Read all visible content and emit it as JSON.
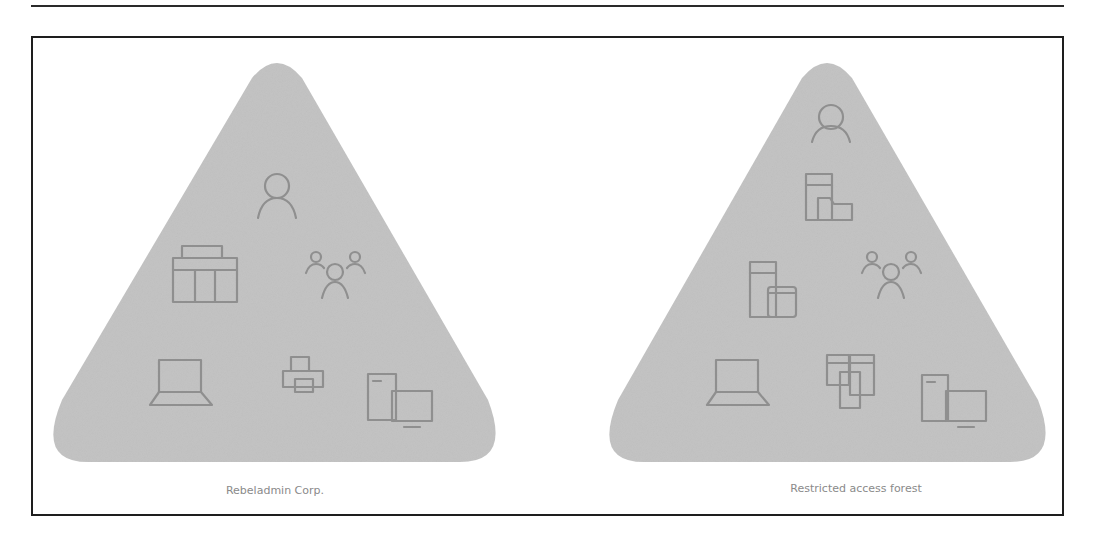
{
  "colors": {
    "rule": "#2a2a2a",
    "frame": "#1e1e1e",
    "triangle_fill": "#c4c4c4",
    "icon_stroke": "#8f8f8f",
    "caption_text": "#8a8a8a"
  },
  "panels": [
    {
      "caption": "Rebeladmin Corp.",
      "icons": [
        "user-icon",
        "building-icon",
        "group-icon",
        "laptop-icon",
        "printer-icon",
        "devices-icon"
      ]
    },
    {
      "caption": "Restricted access forest",
      "icons": [
        "user-icon",
        "server-folder-icon",
        "server-database-icon",
        "group-icon",
        "laptop-icon",
        "files-icon",
        "devices-icon"
      ]
    }
  ]
}
